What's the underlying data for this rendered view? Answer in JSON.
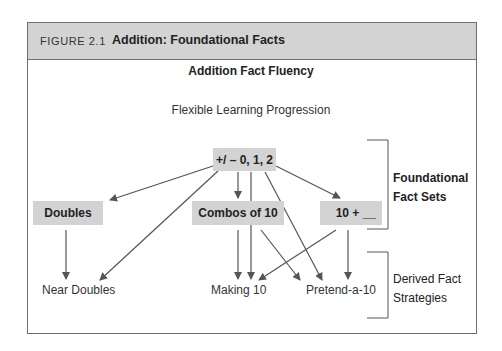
{
  "figure": {
    "number": "FIGURE 2.1",
    "title": "Addition: Foundational Facts"
  },
  "diagram": {
    "title": "Addition Fact Fluency",
    "subtitle": "Flexible Learning Progression",
    "nodes": {
      "root": "+/ – 0, 1, 2",
      "doubles": "Doubles",
      "combos": "Combos of 10",
      "ten_plus": "10 + __",
      "near_doubles": "Near Doubles",
      "making_10": "Making 10",
      "pretend_a_10": "Pretend-a-10"
    },
    "edges": [
      [
        "root",
        "doubles"
      ],
      [
        "root",
        "near_doubles"
      ],
      [
        "root",
        "combos"
      ],
      [
        "root",
        "making_10"
      ],
      [
        "root",
        "pretend_a_10"
      ],
      [
        "root",
        "ten_plus"
      ],
      [
        "doubles",
        "near_doubles"
      ],
      [
        "combos",
        "making_10"
      ],
      [
        "combos",
        "pretend_a_10"
      ],
      [
        "ten_plus",
        "making_10"
      ],
      [
        "ten_plus",
        "pretend_a_10"
      ]
    ],
    "groups": {
      "foundational": {
        "line1": "Foundational",
        "line2": "Fact Sets"
      },
      "derived": {
        "line1": "Derived Fact",
        "line2": "Strategies"
      }
    },
    "colors": {
      "box_fill": "#d3d3d3",
      "arrow": "#555555",
      "header_fill": "#d3d3d3"
    }
  }
}
